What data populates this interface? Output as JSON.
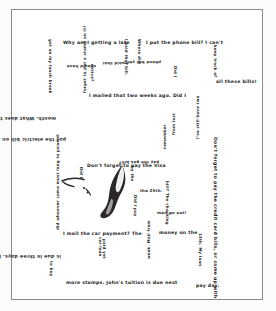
{
  "artwork": {
    "title": "Bill Anxiety Spiral",
    "medium_note": "handwritten spiral text with central brush figure",
    "frame_color": "#8a8a88",
    "ink_color": "#1b1b1b",
    "paper_color": "#ffffff"
  },
  "figure": {
    "name": "brush-stroke-bird",
    "ink_color": "#2a2726"
  },
  "spiral": {
    "full_text": "Why am I getting a late notice? I paid that bill. Where did I put the phone bill? I can't keep track of all these bills! I mailed that two weeks ago. Did I forget to put a stamp on it? How long does it take to get from the post office? I still have two months. What does the post office charge? I'll pay the electric bill on my way to work. Did I remember to pay the gas bill? Don't forget to pay the Visa by the 25th. Did I mail the car payment? The money on the 15th. The checking account is low. Do I have enough money to pay the credit card bills, or come up with more stamps. John's tuition is due next pay day.",
    "segments": [
      {
        "id": "s01",
        "text": "Why am I getting a late",
        "x": 52,
        "y": 32,
        "rot": 0,
        "size": "lg"
      },
      {
        "id": "s02",
        "text": "I paid that bill.",
        "x": 117,
        "y": 30,
        "rot": 90,
        "size": "sm"
      },
      {
        "id": "s03",
        "text": "Where did",
        "x": 130,
        "y": 30,
        "rot": 90,
        "size": "sm"
      },
      {
        "id": "s04",
        "text": "I put the phone bill? I can't",
        "x": 135,
        "y": 32,
        "rot": 0,
        "size": "lg"
      },
      {
        "id": "s05",
        "text": "keep track of",
        "x": 206,
        "y": 36,
        "rot": 90,
        "size": "sm"
      },
      {
        "id": "s06",
        "text": "all these bills!",
        "x": 205,
        "y": 71,
        "rot": 0,
        "size": "lg"
      },
      {
        "id": "s07",
        "text": "notice?",
        "x": 83,
        "y": 55,
        "rot": 90,
        "size": "sm"
      },
      {
        "id": "s08",
        "text": "should have",
        "x": 85,
        "y": 59,
        "rot": 180,
        "size": "sm"
      },
      {
        "id": "s09",
        "text": "I paid that",
        "x": 117,
        "y": 56,
        "rot": 180,
        "size": "sm"
      },
      {
        "id": "s10",
        "text": "phone bill yet?",
        "x": 150,
        "y": 55,
        "rot": 180,
        "size": "sm"
      },
      {
        "id": "s11",
        "text": "Did I",
        "x": 166,
        "y": 57,
        "rot": 90,
        "size": "sm"
      },
      {
        "id": "s12",
        "text": "I mailed that two weeks ago. Did I",
        "x": 78,
        "y": 85,
        "rot": 0,
        "size": "lg"
      },
      {
        "id": "s13",
        "text": "forget to put a stamp on it?",
        "x": 72,
        "y": 84,
        "rot": 270,
        "size": "sm"
      },
      {
        "id": "s14",
        "text": "month. What does the post office charge? I'll",
        "x": 45,
        "y": 111,
        "rot": 180,
        "size": "lg"
      },
      {
        "id": "s15",
        "text": "get on my lunch break",
        "x": 41,
        "y": 30,
        "rot": 90,
        "size": "sm"
      },
      {
        "id": "s16",
        "text": "from last",
        "x": 161,
        "y": 126,
        "rot": 270,
        "size": "sm"
      },
      {
        "id": "s17",
        "text": "I've still have two",
        "x": 185,
        "y": 130,
        "rot": 270,
        "size": "sm"
      },
      {
        "id": "s18",
        "text": "pay the electric bill on my way to work.",
        "x": 55,
        "y": 132,
        "rot": 180,
        "size": "lg"
      },
      {
        "id": "s19",
        "text": "remember",
        "x": 152,
        "y": 140,
        "rot": 270,
        "size": "sm"
      },
      {
        "id": "s20",
        "text": "Don't forget to pay the Visa",
        "x": 76,
        "y": 155,
        "rot": 0,
        "size": "lg"
      },
      {
        "id": "s21",
        "text": "Did I",
        "x": 72,
        "y": 158,
        "rot": 90,
        "size": "sm"
      },
      {
        "id": "s22",
        "text": "by the",
        "x": 123,
        "y": 157,
        "rot": 90,
        "size": "sm"
      },
      {
        "id": "s23",
        "text": "pay the gas bill?",
        "x": 148,
        "y": 155,
        "rot": 180,
        "size": "sm"
      },
      {
        "id": "s24",
        "text": "the 25th.",
        "x": 129,
        "y": 180,
        "rot": 0,
        "size": "sm"
      },
      {
        "id": "s25",
        "text": "Did I pay",
        "x": 126,
        "y": 186,
        "rot": 90,
        "size": "sm"
      },
      {
        "id": "s26",
        "text": "bill? The checking",
        "x": 158,
        "y": 172,
        "rot": 90,
        "size": "sm"
      },
      {
        "id": "s27",
        "text": "mail go out!",
        "x": 146,
        "y": 202,
        "rot": 0,
        "size": "sm"
      },
      {
        "id": "s28",
        "text": "did whoever come must long to pawn it",
        "x": 45,
        "y": 221,
        "rot": 270,
        "size": "sm"
      },
      {
        "id": "s29",
        "text": "I mail the car payment? The",
        "x": 52,
        "y": 223,
        "rot": 0,
        "size": "lg"
      },
      {
        "id": "s30",
        "text": "money on the",
        "x": 148,
        "y": 222,
        "rot": 0,
        "size": "lg"
      },
      {
        "id": "s31",
        "text": "15th. My loan",
        "x": 191,
        "y": 224,
        "rot": 90,
        "size": "sm"
      },
      {
        "id": "s32",
        "text": "car loan",
        "x": 91,
        "y": 228,
        "rot": 90,
        "size": "sm"
      },
      {
        "id": "s33",
        "text": "paid yet",
        "x": 95,
        "y": 230,
        "rot": 90,
        "size": "sm"
      },
      {
        "id": "s34",
        "text": "is due in three days. Dad, I forgot",
        "x": 50,
        "y": 249,
        "rot": 180,
        "size": "lg"
      },
      {
        "id": "s35",
        "text": "week. Mail from",
        "x": 136,
        "y": 250,
        "rot": 270,
        "size": "sm"
      },
      {
        "id": "s36",
        "text": "to buy",
        "x": 42,
        "y": 252,
        "rot": 90,
        "size": "sm"
      },
      {
        "id": "s37",
        "text": "Don't forget to pay the credit card bills, or come up with",
        "x": 206,
        "y": 128,
        "rot": 90,
        "size": "lg"
      },
      {
        "id": "s38",
        "text": "more stamps. John's tuition is due next",
        "x": 55,
        "y": 272,
        "rot": 0,
        "size": "lg"
      },
      {
        "id": "s39",
        "text": "pay day.",
        "x": 185,
        "y": 275,
        "rot": 0,
        "size": "lg"
      }
    ]
  }
}
